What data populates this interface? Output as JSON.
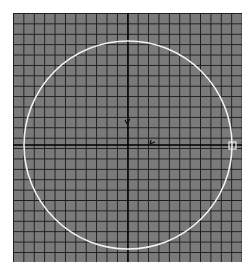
{
  "viewport": {
    "type": "ortho-grid-view",
    "background_color": "#7a7a7a",
    "grid_line_color": "#1e1e1e",
    "axis_color": "#000000"
  },
  "circle": {
    "shape": "circle",
    "stroke_color": "#f0f0f0",
    "center": [
      128,
      145
    ],
    "radius": 104
  },
  "origin_gizmo": {
    "x_axis_label": "x",
    "y_axis_label": "y"
  },
  "handle": {
    "name": "selected-vertex-handle",
    "position": [
      232,
      146
    ]
  }
}
